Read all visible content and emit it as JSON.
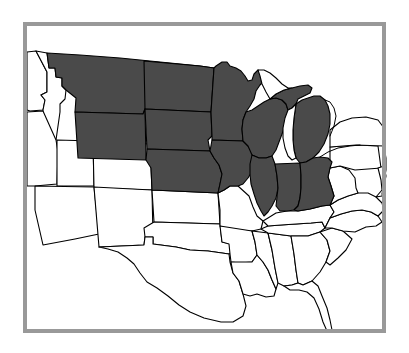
{
  "figure": {
    "kind": "choropleth-map",
    "width": 409,
    "height": 353,
    "background_color": "#ffffff"
  },
  "frame": {
    "border_color": "#999999",
    "border_width": 4,
    "left": 23,
    "top": 22,
    "right": 386,
    "bottom": 333
  },
  "legend": {
    "shaded_fill": "#4a4a4a",
    "unshaded_fill": "#ffffff",
    "outline_color": "#000000",
    "shaded_meaning": "Highlighted region",
    "unshaded_meaning": "Other states"
  },
  "map_data": {
    "type": "choropleth",
    "region": "United States (contiguous, western edge cropped)",
    "shaded_states": [
      "Montana",
      "Wyoming",
      "North Dakota",
      "South Dakota",
      "Nebraska",
      "Minnesota",
      "Iowa",
      "Wisconsin",
      "Michigan",
      "Illinois",
      "Indiana",
      "Ohio"
    ],
    "unshaded_states": [
      "Idaho",
      "Nevada",
      "Utah",
      "Arizona",
      "Colorado",
      "New Mexico",
      "Kansas",
      "Oklahoma",
      "Texas",
      "Missouri",
      "Arkansas",
      "Louisiana",
      "Mississippi",
      "Alabama",
      "Tennessee",
      "Kentucky",
      "Georgia",
      "Florida",
      "South Carolina",
      "North Carolina",
      "Virginia",
      "West Virginia",
      "Pennsylvania",
      "New York"
    ],
    "water_bodies": [
      "Lake Michigan",
      "Lake Superior",
      "Lake Huron",
      "Lake Erie"
    ]
  }
}
